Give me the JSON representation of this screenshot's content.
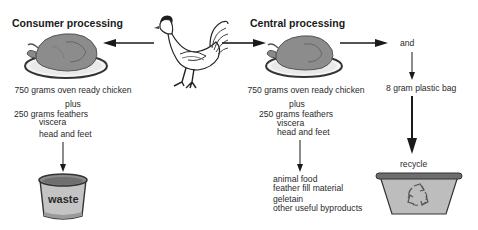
{
  "diagram": {
    "left": {
      "title": "Consumer processing",
      "lines": [
        "750 grams oven ready chicken",
        "plus",
        "250 grams feathers",
        "viscera",
        "head and feet"
      ],
      "destination": {
        "label": "waste",
        "icon": "waste-bin-icon"
      }
    },
    "center": {
      "source_icon": "live-chicken-icon"
    },
    "right": {
      "title": "Central processing",
      "lines": [
        "750 grams oven ready chicken",
        "plus",
        "250 grams feathers",
        "viscera",
        "head and feet"
      ],
      "byproducts": [
        "animal food",
        "feather fill material",
        "geletain",
        "other useful byproducts"
      ]
    },
    "packaging": {
      "connector": "and",
      "item": "8 gram plastic bag",
      "destination": {
        "label": "recycle",
        "icon": "recycle-bin-icon"
      }
    },
    "colors": {
      "roast": "#8a8a8a",
      "plate": "#f2f2f2",
      "bin": "#bdbdbd",
      "line": "#1a1a1a"
    }
  }
}
